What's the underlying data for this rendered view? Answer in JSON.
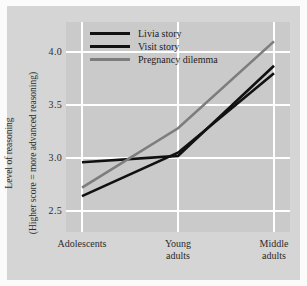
{
  "chart_data": {
    "type": "line",
    "title": "",
    "xlabel": "",
    "ylabel": "Level of reasoning\n(Higher score = more advanced reasoning)",
    "categories": [
      "Adolescents",
      "Young\nadults",
      "Middle\nadults"
    ],
    "yticks": [
      "2.5",
      "3.0",
      "3.5",
      "4.0"
    ],
    "ytick_values": [
      2.5,
      3.0,
      3.5,
      4.0
    ],
    "ylim": [
      2.4,
      4.2
    ],
    "grid": true,
    "legend_position": "inside top-left",
    "series": [
      {
        "name": "Livia story",
        "color": "#111111",
        "values": [
          2.96,
          3.02,
          3.87
        ]
      },
      {
        "name": "Visit story",
        "color": "#111111",
        "values": [
          2.64,
          3.05,
          3.8
        ]
      },
      {
        "name": "Pregnancy dilemma",
        "color": "#7d7d7d",
        "values": [
          2.72,
          3.28,
          4.1
        ]
      }
    ]
  },
  "figure": {
    "background_color": "#fbfbfb",
    "panel_color": "#d5d5d5",
    "plot_color": "#cacaca",
    "gridline_color": "#ffffff"
  },
  "ylabel_line1": "Level of reasoning",
  "ylabel_line2": "(Higher score = more advanced reasoning)",
  "yticks": {
    "t0": "2.5",
    "t1": "3.0",
    "t2": "3.5",
    "t3": "4.0"
  },
  "xticks": {
    "t0": "Adolescents",
    "t1": "Young\nadults",
    "t2": "Middle\nadults"
  },
  "legend": {
    "item0": "Livia story",
    "item1": "Visit story",
    "item2": "Pregnancy dilemma"
  }
}
